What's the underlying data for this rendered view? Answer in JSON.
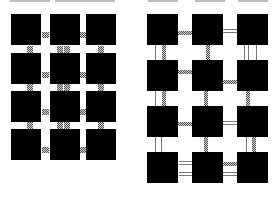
{
  "figure": {
    "colors": {
      "tile": "#000000",
      "hatch_dark": "#555555",
      "hatch_light": "#cfcfcf",
      "background": "#ffffff"
    },
    "left_panel": {
      "label": "dense grid with hatched pad connectors",
      "rows": 4,
      "cols": 3,
      "tile_size": [
        30,
        31
      ],
      "col_x": [
        11,
        50,
        86
      ],
      "row_y": [
        14,
        53,
        91,
        129
      ],
      "h_pads": [
        {
          "x": 42,
          "y": 32
        },
        {
          "x": 80,
          "y": 32
        },
        {
          "x": 42,
          "y": 72
        },
        {
          "x": 80,
          "y": 72
        },
        {
          "x": 42,
          "y": 109
        },
        {
          "x": 80,
          "y": 109
        },
        {
          "x": 42,
          "y": 147
        },
        {
          "x": 80,
          "y": 147
        }
      ],
      "v_pads": [
        {
          "x": 27,
          "y": 46
        },
        {
          "x": 57,
          "y": 46
        },
        {
          "x": 64,
          "y": 46
        },
        {
          "x": 98,
          "y": 46
        },
        {
          "x": 27,
          "y": 84
        },
        {
          "x": 57,
          "y": 84
        },
        {
          "x": 64,
          "y": 84
        },
        {
          "x": 98,
          "y": 84
        },
        {
          "x": 27,
          "y": 122
        },
        {
          "x": 57,
          "y": 122
        },
        {
          "x": 64,
          "y": 122
        },
        {
          "x": 98,
          "y": 122
        }
      ]
    },
    "right_panel": {
      "label": "spaced grid with line/bar connectors",
      "rows": 4,
      "cols": 3,
      "tile_size": [
        31,
        31
      ],
      "col_x": [
        147,
        192,
        237
      ],
      "row_y": [
        14,
        60,
        106,
        152
      ],
      "h_links": [
        {
          "x": 178,
          "y": 31,
          "w": 14,
          "type": "bar"
        },
        {
          "x": 222,
          "y": 29,
          "w": 15,
          "type": "double"
        },
        {
          "x": 178,
          "y": 70,
          "w": 14,
          "type": "bar"
        },
        {
          "x": 222,
          "y": 80,
          "w": 15,
          "type": "bar"
        },
        {
          "x": 178,
          "y": 122,
          "w": 14,
          "type": "bar"
        },
        {
          "x": 222,
          "y": 121,
          "w": 15,
          "type": "double"
        },
        {
          "x": 179,
          "y": 161,
          "w": 14,
          "type": "double"
        },
        {
          "x": 179,
          "y": 172,
          "w": 14,
          "type": "double"
        },
        {
          "x": 223,
          "y": 162,
          "w": 15,
          "type": "bar"
        },
        {
          "x": 223,
          "y": 172,
          "w": 15,
          "type": "double"
        }
      ],
      "v_links": [
        {
          "x": 155,
          "y": 45,
          "h": 15,
          "type": "line"
        },
        {
          "x": 162,
          "y": 45,
          "h": 15,
          "type": "bar"
        },
        {
          "x": 206,
          "y": 45,
          "h": 15,
          "type": "bar"
        },
        {
          "x": 244,
          "y": 45,
          "h": 15,
          "type": "line"
        },
        {
          "x": 248,
          "y": 45,
          "h": 15,
          "type": "line"
        },
        {
          "x": 256,
          "y": 45,
          "h": 15,
          "type": "line"
        },
        {
          "x": 155,
          "y": 91,
          "h": 15,
          "type": "line"
        },
        {
          "x": 162,
          "y": 91,
          "h": 15,
          "type": "bar"
        },
        {
          "x": 204,
          "y": 91,
          "h": 15,
          "type": "bar"
        },
        {
          "x": 246,
          "y": 91,
          "h": 15,
          "type": "bar"
        },
        {
          "x": 155,
          "y": 137,
          "h": 15,
          "type": "line"
        },
        {
          "x": 161,
          "y": 137,
          "h": 15,
          "type": "line"
        },
        {
          "x": 204,
          "y": 137,
          "h": 15,
          "type": "bar"
        },
        {
          "x": 246,
          "y": 137,
          "h": 15,
          "type": "line"
        },
        {
          "x": 252,
          "y": 137,
          "h": 15,
          "type": "bar"
        }
      ]
    }
  }
}
